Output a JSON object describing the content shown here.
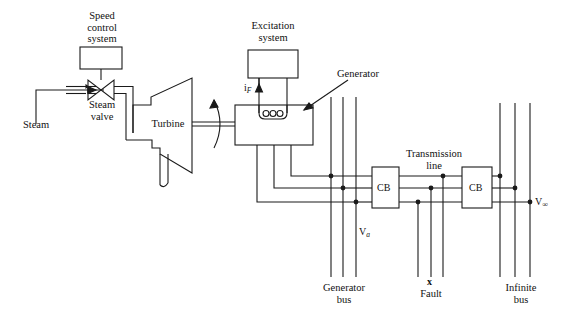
{
  "figure": {
    "type": "single-line-power-system-schematic",
    "stroke_color": "#1a1a1a",
    "background": "#ffffff"
  },
  "labels": {
    "speed_control": "Speed\ncontrol\nsystem",
    "steam": "Steam",
    "steam_valve": "Steam\nvalve",
    "turbine": "Turbine",
    "excitation": "Excitation\nsystem",
    "field_current": "i",
    "field_current_sub": "F",
    "generator": "Generator",
    "generator_bus": "Generator\nbus",
    "terminal_voltage": "V",
    "terminal_voltage_sub": "a",
    "cb_left": "CB",
    "cb_right": "CB",
    "transmission_line": "Transmission\nline",
    "fault_mark": "x",
    "fault": "Fault",
    "infinite_bus": "Infinite\nbus",
    "infinite_voltage": "V",
    "infinite_voltage_sub": "∞"
  },
  "components": {
    "speed_control_box": {
      "x": 80,
      "y": 47,
      "w": 42,
      "h": 22
    },
    "excitation_box": {
      "x": 248,
      "y": 50,
      "w": 50,
      "h": 28
    },
    "generator_box": {
      "x": 235,
      "y": 105,
      "w": 78,
      "h": 40
    },
    "cb_left_box": {
      "x": 372,
      "y": 167,
      "w": 27,
      "h": 41
    },
    "cb_right_box": {
      "x": 462,
      "y": 167,
      "w": 30,
      "h": 41
    },
    "generator_bus_lines_x": [
      331,
      343,
      356
    ],
    "fault_lines_x": [
      418,
      431,
      443
    ],
    "infinite_bus_lines_x": [
      500,
      515,
      530
    ],
    "phase_line_y": [
      176,
      188,
      202
    ]
  }
}
